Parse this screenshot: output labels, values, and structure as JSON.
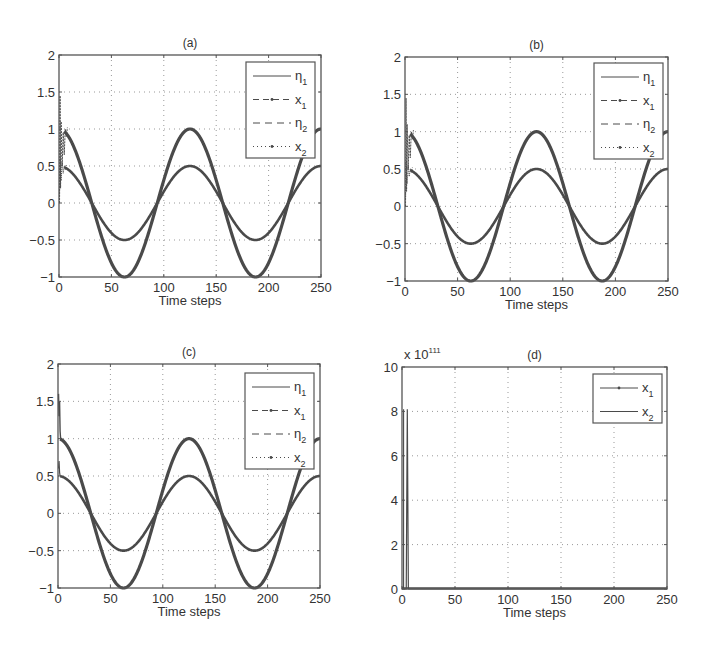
{
  "chart_data": [
    {
      "panel": "(a)",
      "type": "line",
      "title": "(a)",
      "xlabel": "Time steps",
      "ylabel": "",
      "xlim": [
        0,
        250
      ],
      "ylim": [
        -1,
        2
      ],
      "xticks": [
        "0",
        "50",
        "100",
        "150",
        "200",
        "250"
      ],
      "yticks": [
        "-1",
        "-0.5",
        "0",
        "0.5",
        "1",
        "1.5",
        "2"
      ],
      "grid": true,
      "legend_position": "upper right",
      "legend": [
        "η1",
        "x1",
        "η2",
        "x2"
      ],
      "series": [
        {
          "name": "η1",
          "style": "solid",
          "formula": "1.0*cos(2*pi*t/125)",
          "x": [
            0,
            31,
            62.5,
            94,
            125,
            156,
            187.5,
            219,
            250
          ],
          "values": [
            1,
            0,
            -1,
            0,
            1,
            0,
            -1,
            0,
            1
          ]
        },
        {
          "name": "x1",
          "style": "dash-dot markers",
          "note": "tracks η1 after initial transient (t<10, values between ~0.5 and ~1.5)",
          "x": [
            0,
            31,
            62.5,
            94,
            125,
            156,
            187.5,
            219,
            250
          ],
          "values": [
            1,
            0,
            -1,
            0,
            1,
            0,
            -1,
            0,
            1
          ]
        },
        {
          "name": "η2",
          "style": "dashed",
          "formula": "0.5*cos(2*pi*t/125)",
          "x": [
            0,
            31,
            62.5,
            94,
            125,
            156,
            187.5,
            219,
            250
          ],
          "values": [
            0.5,
            0,
            -0.5,
            0,
            0.5,
            0,
            -0.5,
            0,
            0.5
          ]
        },
        {
          "name": "x2",
          "style": "dotted markers",
          "note": "tracks η2 after initial transient",
          "x": [
            0,
            31,
            62.5,
            94,
            125,
            156,
            187.5,
            219,
            250
          ],
          "values": [
            0.5,
            0,
            -0.5,
            0,
            0.5,
            0,
            -0.5,
            0,
            0.5
          ]
        }
      ],
      "transient": {
        "t_range": [
          0,
          8
        ],
        "min": 0.0,
        "max": 1.5
      }
    },
    {
      "panel": "(b)",
      "type": "line",
      "title": "(b)",
      "xlabel": "Time steps",
      "ylabel": "",
      "xlim": [
        0,
        250
      ],
      "ylim": [
        -1,
        2
      ],
      "xticks": [
        "0",
        "50",
        "100",
        "150",
        "200",
        "250"
      ],
      "yticks": [
        "-1",
        "-0.5",
        "0",
        "0.5",
        "1",
        "1.5",
        "2"
      ],
      "grid": true,
      "legend_position": "upper right",
      "legend": [
        "η1",
        "x1",
        "η2",
        "x2"
      ],
      "series": [
        {
          "name": "η1",
          "style": "solid",
          "formula": "1.0*cos(2*pi*t/125)",
          "x": [
            0,
            31,
            62.5,
            94,
            125,
            156,
            187.5,
            219,
            250
          ],
          "values": [
            1,
            0,
            -1,
            0,
            1,
            0,
            -1,
            0,
            1
          ]
        },
        {
          "name": "x1",
          "style": "dash-dot markers",
          "x": [
            0,
            31,
            62.5,
            94,
            125,
            156,
            187.5,
            219,
            250
          ],
          "values": [
            1,
            0,
            -1,
            0,
            1,
            0,
            -1,
            0,
            1
          ]
        },
        {
          "name": "η2",
          "style": "dashed",
          "formula": "0.5*cos(2*pi*t/125)",
          "x": [
            0,
            31,
            62.5,
            94,
            125,
            156,
            187.5,
            219,
            250
          ],
          "values": [
            0.5,
            0,
            -0.5,
            0,
            0.5,
            0,
            -0.5,
            0,
            0.5
          ]
        },
        {
          "name": "x2",
          "style": "dotted markers",
          "x": [
            0,
            31,
            62.5,
            94,
            125,
            156,
            187.5,
            219,
            250
          ],
          "values": [
            0.5,
            0,
            -0.5,
            0,
            0.5,
            0,
            -0.5,
            0,
            0.5
          ]
        }
      ],
      "transient": {
        "t_range": [
          0,
          8
        ],
        "min": 0.0,
        "max": 1.5
      }
    },
    {
      "panel": "(c)",
      "type": "line",
      "title": "(c)",
      "xlabel": "Time steps",
      "ylabel": "",
      "xlim": [
        0,
        250
      ],
      "ylim": [
        -1,
        2
      ],
      "xticks": [
        "0",
        "50",
        "100",
        "150",
        "200",
        "250"
      ],
      "yticks": [
        "-1",
        "-0.5",
        "0",
        "0.5",
        "1",
        "1.5",
        "2"
      ],
      "grid": true,
      "legend_position": "upper right",
      "legend": [
        "η1",
        "x1",
        "η2",
        "x2"
      ],
      "series": [
        {
          "name": "η1",
          "style": "solid",
          "formula": "1.0*cos(2*pi*t/125)",
          "x": [
            0,
            31,
            62.5,
            94,
            125,
            156,
            187.5,
            219,
            250
          ],
          "values": [
            1,
            0,
            -1,
            0,
            1,
            0,
            -1,
            0,
            1
          ]
        },
        {
          "name": "x1",
          "style": "dash-dot markers",
          "x": [
            0,
            31,
            62.5,
            94,
            125,
            156,
            187.5,
            219,
            250
          ],
          "values": [
            1,
            0,
            -1,
            0,
            1,
            0,
            -1,
            0,
            1
          ]
        },
        {
          "name": "η2",
          "style": "dashed",
          "formula": "0.5*cos(2*pi*t/125)",
          "x": [
            0,
            31,
            62.5,
            94,
            125,
            156,
            187.5,
            219,
            250
          ],
          "values": [
            0.5,
            0,
            -0.5,
            0,
            0.5,
            0,
            -0.5,
            0,
            0.5
          ]
        },
        {
          "name": "x2",
          "style": "dotted markers",
          "x": [
            0,
            31,
            62.5,
            94,
            125,
            156,
            187.5,
            219,
            250
          ],
          "values": [
            0.5,
            0,
            -0.5,
            0,
            0.5,
            0,
            -0.5,
            0,
            0.5
          ]
        }
      ],
      "transient": {
        "t_range": [
          0,
          3
        ],
        "min": 0.5,
        "max": 1.6
      }
    },
    {
      "panel": "(d)",
      "type": "line",
      "title": "(d)",
      "xlabel": "Time steps",
      "ylabel": "",
      "y_multiplier": "x 10^111",
      "xlim": [
        0,
        250
      ],
      "ylim": [
        0,
        10
      ],
      "xticks": [
        "0",
        "50",
        "100",
        "150",
        "200",
        "250"
      ],
      "yticks": [
        "0",
        "2",
        "4",
        "6",
        "8",
        "10"
      ],
      "grid": true,
      "legend_position": "upper right",
      "legend": [
        "x1",
        "x2"
      ],
      "series": [
        {
          "name": "x1",
          "style": "solid with markers",
          "x": [
            0,
            1,
            2,
            3,
            4,
            5,
            250
          ],
          "values": [
            0,
            0,
            0,
            0,
            0,
            0,
            0
          ]
        },
        {
          "name": "x2",
          "style": "solid",
          "x": [
            0,
            4,
            5,
            6,
            250
          ],
          "values": [
            0,
            0,
            8.1,
            0,
            0
          ]
        }
      ]
    }
  ],
  "panels": {
    "a": {
      "title": "(a)",
      "xlabel": "Time steps"
    },
    "b": {
      "title": "(b)",
      "xlabel": "Time steps"
    },
    "c": {
      "title": "(c)",
      "xlabel": "Time steps"
    },
    "d": {
      "title": "(d)",
      "xlabel": "Time steps",
      "multiplier_base": "x 10",
      "multiplier_exp": "111"
    }
  },
  "ticks": {
    "x": [
      "0",
      "50",
      "100",
      "150",
      "200",
      "250"
    ],
    "y_abc": [
      "2",
      "1.5",
      "1",
      "0.5",
      "0",
      "−0.5",
      "−1"
    ],
    "y_d": [
      "10",
      "8",
      "6",
      "4",
      "2",
      "0"
    ]
  },
  "legend4": [
    {
      "sym": "η",
      "sub": "1",
      "style": "solid"
    },
    {
      "sym": "x",
      "sub": "1",
      "style": "dashdot"
    },
    {
      "sym": "η",
      "sub": "2",
      "style": "dashed"
    },
    {
      "sym": "x",
      "sub": "2",
      "style": "dotted"
    }
  ],
  "legend2": [
    {
      "sym": "x",
      "sub": "1",
      "style": "solid-marker"
    },
    {
      "sym": "x",
      "sub": "2",
      "style": "solid"
    }
  ],
  "colors": {
    "line": "#4a4a4a",
    "axis": "#555555",
    "grid": "#999999",
    "text": "#333333"
  }
}
